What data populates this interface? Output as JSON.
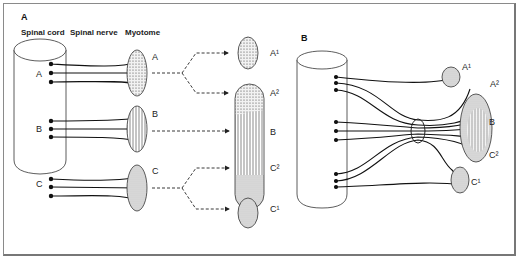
{
  "panel_a": {
    "label": "A",
    "headers": {
      "spinal_cord": "Spinal cord",
      "spinal_nerve": "Spinal nerve",
      "myotome": "Myotome"
    },
    "cord_levels": [
      "A",
      "B",
      "C"
    ],
    "myotome_labels": [
      "A",
      "B",
      "C"
    ],
    "result_labels": {
      "a1": "A¹",
      "a2": "A²",
      "b": "B",
      "c2": "C²",
      "c1": "C¹"
    }
  },
  "panel_b": {
    "label": "B",
    "result_labels": {
      "a1": "A¹",
      "a2": "A²",
      "b": "B",
      "c2": "C²",
      "c1": "C¹"
    }
  }
}
